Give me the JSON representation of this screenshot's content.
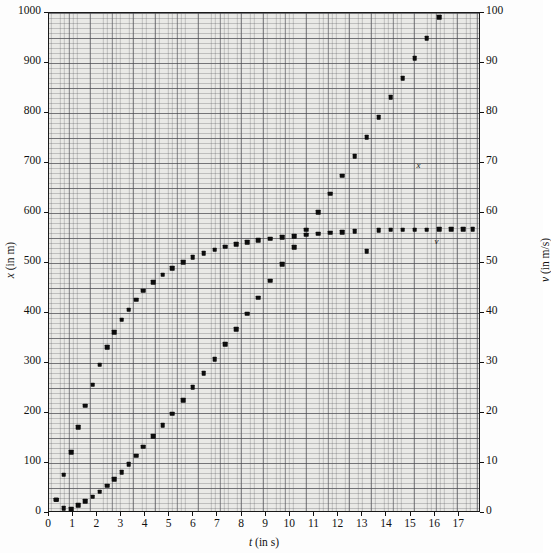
{
  "figure": {
    "background_color": "#fdfdfd",
    "plot_background_color": "#e9e9e6",
    "frame_color": "#1a1a1a",
    "marker_color": "#0d0d0d"
  },
  "axes": {
    "x_title_var": "t",
    "x_title_unit": "(in s)",
    "y_left_var": "x",
    "y_left_unit": "(in m)",
    "y_right_var": "v",
    "y_right_unit": "(in m/s)"
  },
  "labels": {
    "series_x_tag": "x",
    "series_v_tag": "v"
  },
  "chart_data": {
    "type": "scatter",
    "title": "",
    "xlabel": "t (in s)",
    "ylabel": "x (in m)",
    "y2label": "v (in m/s)",
    "xlim": [
      0,
      17.9
    ],
    "ylim": [
      0,
      1000
    ],
    "y2lim": [
      0,
      100
    ],
    "xticks": [
      0,
      1,
      2,
      3,
      4,
      5,
      6,
      7,
      8,
      9,
      10,
      11,
      12,
      13,
      14,
      15,
      16,
      17
    ],
    "xticklabels": [
      "0",
      "1",
      "2",
      "3",
      "4",
      "5",
      "6",
      "7",
      "8",
      "9",
      "10",
      "11",
      "12",
      "13",
      "14",
      "15",
      "16",
      "17"
    ],
    "yticks": [
      0,
      100,
      200,
      300,
      400,
      500,
      600,
      700,
      800,
      900,
      1000
    ],
    "yticklabels": [
      "0",
      "100",
      "200",
      "300",
      "400",
      "500",
      "600",
      "700",
      "800",
      "900",
      "1000"
    ],
    "y2ticks": [
      0,
      10,
      20,
      30,
      40,
      50,
      60,
      70,
      80,
      90,
      100
    ],
    "y2ticklabels": [
      "0",
      "10",
      "20",
      "30",
      "40",
      "50",
      "60",
      "70",
      "80",
      "90",
      "100"
    ],
    "grid": true,
    "grid_style": "graph-paper minor and major rulings",
    "legend_position": "inline annotations next to curves",
    "series": [
      {
        "name": "v",
        "label": "v",
        "axis": "right",
        "units": "m/s",
        "marker": "square",
        "x": [
          0.35,
          0.65,
          0.95,
          1.25,
          1.55,
          1.85,
          2.15,
          2.45,
          2.75,
          3.05,
          3.35,
          3.65,
          3.95,
          4.35,
          4.75,
          5.15,
          5.6,
          6.0,
          6.45,
          6.9,
          7.35,
          7.8,
          8.25,
          8.7,
          9.2,
          9.7,
          10.2,
          10.7,
          11.2,
          11.7,
          12.2,
          12.7,
          13.2,
          13.7,
          14.2,
          14.7,
          15.2,
          15.7,
          16.2,
          16.7,
          17.2,
          17.6
        ],
        "y": [
          2.5,
          7.5,
          12.0,
          17.0,
          21.3,
          25.5,
          29.5,
          33.0,
          36.0,
          38.5,
          40.5,
          42.5,
          44.3,
          46.0,
          47.5,
          48.8,
          50.0,
          51.0,
          51.8,
          52.5,
          53.1,
          53.6,
          54.0,
          54.4,
          54.7,
          55.0,
          55.2,
          55.5,
          55.7,
          55.9,
          56.0,
          56.2,
          52.2,
          56.4,
          56.5,
          56.5,
          56.5,
          56.5,
          56.6,
          56.6,
          56.6,
          56.6
        ]
      },
      {
        "name": "x",
        "label": "x",
        "axis": "left",
        "units": "m",
        "marker": "square",
        "x": [
          0.35,
          0.65,
          0.95,
          1.25,
          1.55,
          1.85,
          2.15,
          2.45,
          2.75,
          3.05,
          3.35,
          3.65,
          3.95,
          4.35,
          4.75,
          5.15,
          5.6,
          6.0,
          6.45,
          6.9,
          7.35,
          7.8,
          8.25,
          8.7,
          9.2,
          9.7,
          10.2,
          10.7,
          11.2,
          11.7,
          12.2,
          12.7,
          13.2,
          13.7,
          14.2,
          14.7,
          15.2,
          15.7,
          16.2,
          16.7,
          17.2,
          17.6
        ],
        "y": [
          25,
          8,
          6,
          14,
          22,
          31,
          41,
          53,
          66,
          80,
          96,
          113,
          131,
          152,
          174,
          197,
          224,
          250,
          278,
          306,
          336,
          366,
          397,
          429,
          463,
          496,
          530,
          565,
          600,
          637,
          673,
          712,
          750,
          790,
          830,
          868,
          908,
          948,
          990,
          1030,
          1070,
          1105
        ]
      }
    ]
  }
}
